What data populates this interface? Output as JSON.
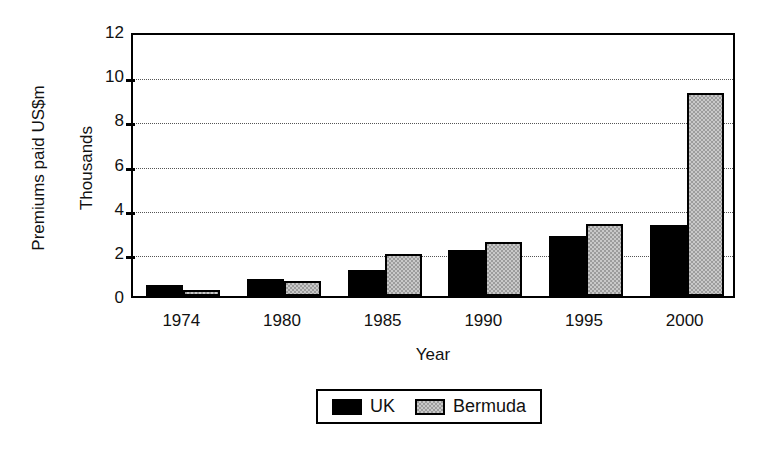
{
  "chart_data": {
    "type": "bar",
    "title": "",
    "subtitle": "",
    "xlabel": "Year",
    "ylabel": "Premiums paid US$m",
    "ylabel_secondary": "Thousands",
    "categories": [
      "1974",
      "1980",
      "1985",
      "1990",
      "1995",
      "2000"
    ],
    "series": [
      {
        "name": "UK",
        "color": "#000000",
        "values": [
          0.5,
          0.75,
          1.2,
          2.1,
          2.7,
          3.2
        ]
      },
      {
        "name": "Bermuda",
        "color": "#9c9c9c",
        "values": [
          0.25,
          0.7,
          1.9,
          2.45,
          3.25,
          9.2
        ]
      }
    ],
    "ylim": [
      0,
      12
    ],
    "yticks": [
      0,
      2,
      4,
      6,
      8,
      10,
      12
    ],
    "ytick_labels": [
      "0",
      "2",
      "4",
      "6",
      "8",
      "10",
      "12"
    ],
    "gridlines": [
      2,
      4,
      6,
      8,
      10
    ],
    "grid": "horizontal-dotted",
    "legend_position": "bottom-center",
    "legend_entries": [
      "UK",
      "Bermuda"
    ]
  },
  "axes": {
    "y_title_outer": "Premiums paid US$m",
    "y_title_inner": "Thousands",
    "x_title": "Year"
  },
  "legend": {
    "items": [
      {
        "label": "UK",
        "swatch": "black-solid-swatch"
      },
      {
        "label": "Bermuda",
        "swatch": "gray-hatched-swatch"
      }
    ]
  }
}
